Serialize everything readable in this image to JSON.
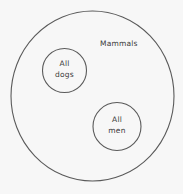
{
  "diagram": {
    "type": "euler",
    "stroke_color": "#5a5a5a",
    "text_color": "#3a3a3a",
    "background": "#f7f7f7",
    "universe": {
      "label": "Mammals"
    },
    "subsets": [
      {
        "id": "dogs",
        "label_line1": "All",
        "label_line2": "dogs"
      },
      {
        "id": "men",
        "label_line1": "All",
        "label_line2": "men"
      }
    ],
    "relationships": [
      {
        "subset": "dogs",
        "contained_in": "Mammals"
      },
      {
        "subset": "men",
        "contained_in": "Mammals"
      },
      {
        "pair": [
          "dogs",
          "men"
        ],
        "relation": "disjoint"
      }
    ]
  }
}
